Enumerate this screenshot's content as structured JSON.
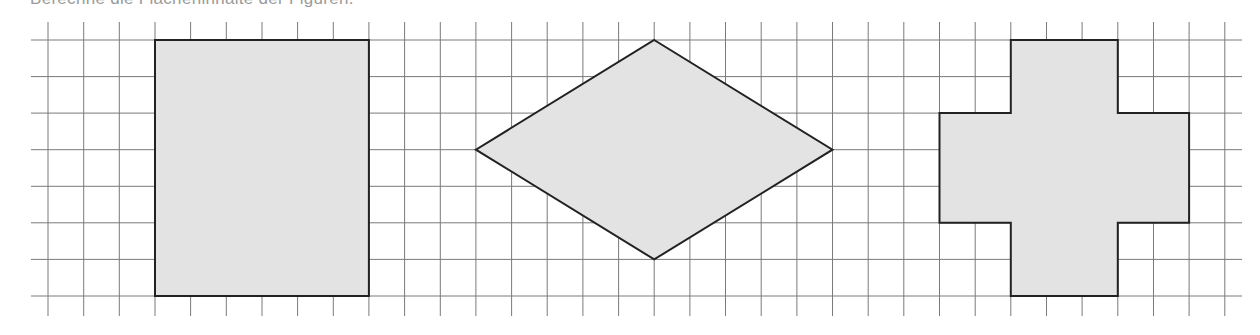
{
  "caption": {
    "text": "Berechne die Flächeninhalte der Figuren.",
    "note": "cropped at top edge; only letter bottoms visible"
  },
  "grid": {
    "origin_x": 48,
    "origin_y": 40,
    "cell_w": 35.66,
    "cell_h": 36.57,
    "cols": 33,
    "rows": 7,
    "v_line_top": 22,
    "v_line_bottom": 316,
    "h_line_left": 31,
    "h_line_right": 1242,
    "line_color": "#7a7a7a",
    "line_width": 1
  },
  "style": {
    "shape_fill": "#e3e3e3",
    "shape_stroke": "#222222",
    "shape_stroke_width": 2
  },
  "shapes": [
    {
      "name": "rectangle",
      "type": "polygon",
      "grid_points": [
        [
          3,
          0
        ],
        [
          9,
          0
        ],
        [
          9,
          7
        ],
        [
          3,
          7
        ]
      ],
      "width_units": 6,
      "height_units": 7
    },
    {
      "name": "rhombus",
      "type": "polygon",
      "grid_points": [
        [
          17,
          0
        ],
        [
          22,
          3
        ],
        [
          17,
          6
        ],
        [
          12,
          3
        ]
      ],
      "diagonal_horizontal_units": 10,
      "diagonal_vertical_units": 6
    },
    {
      "name": "cross",
      "type": "polygon",
      "grid_points": [
        [
          27,
          0
        ],
        [
          30,
          0
        ],
        [
          30,
          2
        ],
        [
          32,
          2
        ],
        [
          32,
          5
        ],
        [
          30,
          5
        ],
        [
          30,
          7
        ],
        [
          27,
          7
        ],
        [
          27,
          5
        ],
        [
          25,
          5
        ],
        [
          25,
          2
        ],
        [
          27,
          2
        ]
      ],
      "arm_width_units": 3,
      "total_width_units": 7,
      "total_height_units": 7
    }
  ]
}
